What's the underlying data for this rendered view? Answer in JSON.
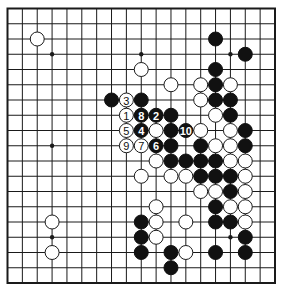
{
  "diagram": {
    "type": "go-board",
    "size": 19,
    "geometry": {
      "left": 7.5,
      "top": 8.5,
      "right": 275,
      "bottom": 283,
      "stone_radius": 7
    },
    "colors": {
      "black": "#111111",
      "white": "#ffffff",
      "line": "#1a1a1a",
      "background": "#ffffff"
    },
    "star_points": [
      [
        3,
        3
      ],
      [
        9,
        3
      ],
      [
        15,
        3
      ],
      [
        3,
        9
      ],
      [
        9,
        9
      ],
      [
        15,
        9
      ],
      [
        3,
        15
      ],
      [
        9,
        15
      ],
      [
        15,
        15
      ]
    ],
    "black_stones": [
      [
        14,
        2
      ],
      [
        16,
        3
      ],
      [
        14,
        4
      ],
      [
        14,
        5
      ],
      [
        7,
        6
      ],
      [
        9,
        6
      ],
      [
        14,
        6
      ],
      [
        15,
        6
      ],
      [
        11,
        7
      ],
      [
        15,
        7
      ],
      [
        11,
        8
      ],
      [
        16,
        8
      ],
      [
        11,
        9
      ],
      [
        13,
        9
      ],
      [
        16,
        9
      ],
      [
        11,
        10
      ],
      [
        12,
        10
      ],
      [
        13,
        10
      ],
      [
        14,
        10
      ],
      [
        13,
        11
      ],
      [
        14,
        11
      ],
      [
        15,
        11
      ],
      [
        15,
        12
      ],
      [
        14,
        13
      ],
      [
        9,
        14
      ],
      [
        14,
        14
      ],
      [
        15,
        14
      ],
      [
        9,
        15
      ],
      [
        16,
        15
      ],
      [
        9,
        16
      ],
      [
        11,
        16
      ],
      [
        14,
        16
      ],
      [
        16,
        16
      ],
      [
        11,
        17
      ]
    ],
    "white_stones": [
      [
        2,
        2
      ],
      [
        9,
        4
      ],
      [
        11,
        5
      ],
      [
        13,
        5
      ],
      [
        15,
        5
      ],
      [
        13,
        6
      ],
      [
        14,
        7
      ],
      [
        10,
        8
      ],
      [
        13,
        8
      ],
      [
        15,
        8
      ],
      [
        14,
        9
      ],
      [
        15,
        9
      ],
      [
        10,
        10
      ],
      [
        15,
        10
      ],
      [
        16,
        10
      ],
      [
        9,
        11
      ],
      [
        11,
        11
      ],
      [
        12,
        11
      ],
      [
        16,
        11
      ],
      [
        13,
        12
      ],
      [
        14,
        12
      ],
      [
        16,
        12
      ],
      [
        10,
        13
      ],
      [
        15,
        13
      ],
      [
        16,
        13
      ],
      [
        3,
        14
      ],
      [
        10,
        14
      ],
      [
        12,
        14
      ],
      [
        16,
        14
      ],
      [
        10,
        15
      ],
      [
        3,
        16
      ],
      [
        12,
        16
      ]
    ],
    "numbered_moves": [
      {
        "n": "1",
        "color": "white",
        "x": 8,
        "y": 7
      },
      {
        "n": "2",
        "color": "black",
        "x": 10,
        "y": 7
      },
      {
        "n": "3",
        "color": "white",
        "x": 8,
        "y": 6
      },
      {
        "n": "4",
        "color": "black",
        "x": 9,
        "y": 8
      },
      {
        "n": "5",
        "color": "white",
        "x": 8,
        "y": 8
      },
      {
        "n": "6",
        "color": "black",
        "x": 10,
        "y": 9
      },
      {
        "n": "7",
        "color": "white",
        "x": 9,
        "y": 9
      },
      {
        "n": "8",
        "color": "black",
        "x": 9,
        "y": 7
      },
      {
        "n": "9",
        "color": "white",
        "x": 8,
        "y": 9
      },
      {
        "n": "10",
        "color": "black",
        "x": 12,
        "y": 8
      }
    ]
  }
}
